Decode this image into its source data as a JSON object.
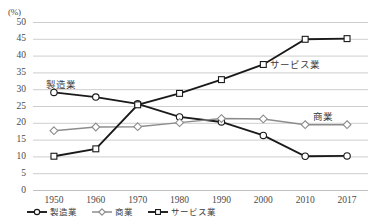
{
  "chart_data": {
    "type": "line",
    "title": "",
    "xlabel": "",
    "ylabel": "(%)",
    "axis_unit": "(%)",
    "categories": [
      "1950",
      "1960",
      "1970",
      "1980",
      "1990",
      "2000",
      "2010",
      "2017"
    ],
    "ylim": [
      0,
      50
    ],
    "y_ticks": [
      "0",
      "5",
      "10",
      "15",
      "20",
      "25",
      "30",
      "35",
      "40",
      "45",
      "50"
    ],
    "grid": true,
    "legend_position": "bottom",
    "series": [
      {
        "name": "製造業",
        "marker": "circle",
        "color": "#1a1a1a",
        "values": [
          29.2,
          27.8,
          25.8,
          21.9,
          20.4,
          16.4,
          10.2,
          10.3
        ]
      },
      {
        "name": "商業",
        "marker": "diamond",
        "color": "#8c8c8c",
        "values": [
          17.8,
          18.9,
          19.0,
          20.2,
          21.4,
          21.3,
          19.6,
          19.6
        ]
      },
      {
        "name": "サービス業",
        "marker": "square",
        "color": "#1a1a1a",
        "values": [
          10.2,
          12.4,
          25.5,
          28.9,
          33.0,
          37.5,
          45.0,
          45.2
        ]
      }
    ],
    "annotations": [
      {
        "text": "製造業",
        "x": 46,
        "y": 81
      },
      {
        "text": "サービス業",
        "x": 270,
        "y": 61
      },
      {
        "text": "商業",
        "x": 313,
        "y": 113
      }
    ]
  },
  "legend": {
    "items": [
      {
        "label": "製造業",
        "marker": "circle",
        "color": "#1a1a1a"
      },
      {
        "label": "商業",
        "marker": "diamond",
        "color": "#8c8c8c"
      },
      {
        "label": "サービス業",
        "marker": "square",
        "color": "#1a1a1a"
      }
    ]
  }
}
